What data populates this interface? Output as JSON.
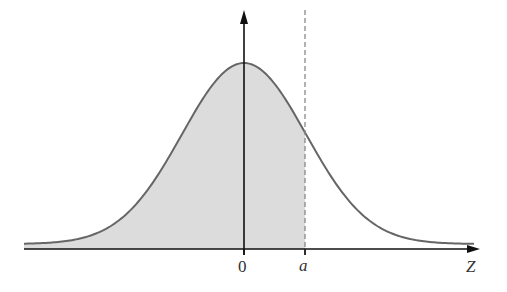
{
  "diagram": {
    "type": "normal-distribution-shaded-area",
    "labels": {
      "origin": "0",
      "a_value": "a",
      "x_axis": "Z"
    },
    "colors": {
      "curve": "#666666",
      "fill": "#dcdcdc",
      "axis": "#111111",
      "dashed_line": "#888888",
      "text": "#333333"
    },
    "geometry": {
      "axis_y": 249,
      "axis_x_start": 24,
      "axis_x_end": 480,
      "origin_x": 244,
      "a_x": 305,
      "peak_y": 63,
      "y_axis_top": 10,
      "sigma_px": 62,
      "baseline_offset_y": 244
    }
  }
}
